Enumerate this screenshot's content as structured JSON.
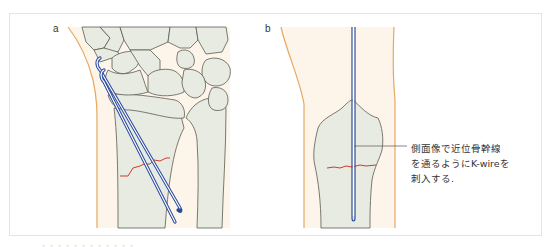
{
  "figure": {
    "panels": [
      {
        "label": "a",
        "view": "frontal (AP) view of wrist with two K-wires inserted obliquely across distal radius fracture"
      },
      {
        "label": "b",
        "view": "lateral view of distal radius with single K-wire along proximal diaphyseal line"
      }
    ],
    "annotation": {
      "lines": [
        "側面像で近位骨幹線",
        "を通るようにK-wireを",
        "刺入する."
      ]
    },
    "caption": "・・・・・・・・・・・・"
  },
  "colors": {
    "frame_border": "#e6e6d6",
    "skin_outline": "#e8a860",
    "skin_fill": "#fdf4ea",
    "bone_fill": "#e8ebe2",
    "bone_outline": "#5a5a52",
    "k_wire": "#2a4aa0",
    "fracture_line": "#d03a2a",
    "leader_line": "#555555",
    "text": "#333333"
  }
}
